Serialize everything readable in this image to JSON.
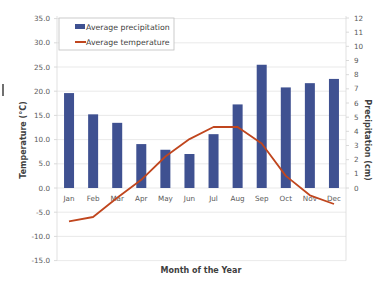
{
  "chart_data": {
    "type": "bar+line",
    "title": "",
    "xlabel": "Month of the Year",
    "ylabel_left": "Temperature (°C)",
    "ylabel_right": "Precipitation (cm)",
    "categories": [
      "Jan",
      "Feb",
      "Mar",
      "Apr",
      "May",
      "Jun",
      "Jul",
      "Aug",
      "Sep",
      "Oct",
      "Nov",
      "Dec"
    ],
    "series": [
      {
        "name": "Average precipitation",
        "type": "bar",
        "axis": "right",
        "color": "#3f5191",
        "values": [
          6.7,
          5.2,
          4.6,
          3.1,
          2.7,
          2.4,
          3.8,
          5.9,
          8.7,
          7.1,
          7.4,
          7.7
        ]
      },
      {
        "name": "Average temperature",
        "type": "line",
        "axis": "left",
        "color": "#c0461e",
        "values": [
          -6.9,
          -6.0,
          -2.0,
          1.7,
          6.5,
          10.1,
          12.6,
          12.6,
          9.2,
          2.5,
          -1.5,
          -3.3
        ]
      }
    ],
    "ylim_left": [
      -15,
      35
    ],
    "yticks_left": [
      "35.0",
      "30.0",
      "25.0",
      "20.0",
      "15.0",
      "10.0",
      "5.0",
      "0.0",
      "-5.0",
      "-10.0",
      "-15.0"
    ],
    "ylim_right": [
      0,
      12
    ],
    "yticks_right": [
      "12",
      "11",
      "10",
      "9",
      "8",
      "7",
      "6",
      "5",
      "4",
      "3",
      "2",
      "1",
      "0"
    ],
    "grid": true,
    "legend_position": "top-left inside"
  },
  "legend": {
    "items": [
      {
        "label": "Average precipitation",
        "color": "#3f5191",
        "shape": "bar"
      },
      {
        "label": "Average temperature",
        "color": "#c0461e",
        "shape": "line"
      }
    ]
  }
}
